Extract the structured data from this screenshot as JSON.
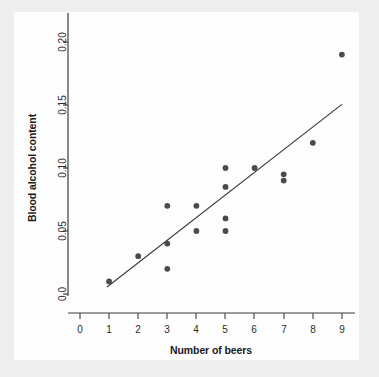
{
  "figure": {
    "background_color": "#eeeeee",
    "plot_background_color": "#fdfdfd",
    "point_color": "#4a4a52",
    "line_color": "#3a3a3a",
    "axis_color": "#3c3c3c"
  },
  "chart_data": {
    "type": "scatter",
    "title": "",
    "xlabel": "Number of beers",
    "ylabel": "Blood alcohol content",
    "xlim": [
      -0.45,
      9.6
    ],
    "ylim": [
      -0.009,
      0.215
    ],
    "grid": false,
    "legend": false,
    "xticks": [
      0,
      1,
      2,
      3,
      4,
      5,
      6,
      7,
      8,
      9
    ],
    "xticklabels": [
      "0",
      "1",
      "2",
      "3",
      "4",
      "5",
      "6",
      "7",
      "8",
      "9"
    ],
    "yticks": [
      0.0,
      0.05,
      0.1,
      0.15,
      0.2
    ],
    "yticklabels": [
      "0.0",
      "0.05",
      "0.10",
      "0.15",
      "0.20"
    ],
    "x": [
      1,
      2,
      3,
      3,
      3,
      4,
      4,
      5,
      5,
      5,
      5,
      6,
      7,
      7,
      8,
      9
    ],
    "y": [
      0.01,
      0.03,
      0.02,
      0.04,
      0.07,
      0.05,
      0.07,
      0.05,
      0.06,
      0.085,
      0.1,
      0.1,
      0.09,
      0.095,
      0.12,
      0.19
    ],
    "points": [
      {
        "x": 1,
        "y": 0.01
      },
      {
        "x": 2,
        "y": 0.03
      },
      {
        "x": 3,
        "y": 0.02
      },
      {
        "x": 3,
        "y": 0.04
      },
      {
        "x": 3,
        "y": 0.07
      },
      {
        "x": 4,
        "y": 0.05
      },
      {
        "x": 4,
        "y": 0.07
      },
      {
        "x": 5,
        "y": 0.05
      },
      {
        "x": 5,
        "y": 0.06
      },
      {
        "x": 5,
        "y": 0.085
      },
      {
        "x": 5,
        "y": 0.1
      },
      {
        "x": 6,
        "y": 0.1
      },
      {
        "x": 7,
        "y": 0.09
      },
      {
        "x": 7,
        "y": 0.095
      },
      {
        "x": 8,
        "y": 0.12
      },
      {
        "x": 9,
        "y": 0.19
      }
    ],
    "series": [
      {
        "name": "Blood alcohol content vs beers",
        "marker": "circle",
        "color": "#4a4a52"
      },
      {
        "name": "least-squares regression line",
        "type": "line",
        "color": "#3a3a3a",
        "x_start": 0.93,
        "y_start": 0.0055,
        "x_end": 9.0,
        "y_end": 0.1505
      }
    ]
  }
}
